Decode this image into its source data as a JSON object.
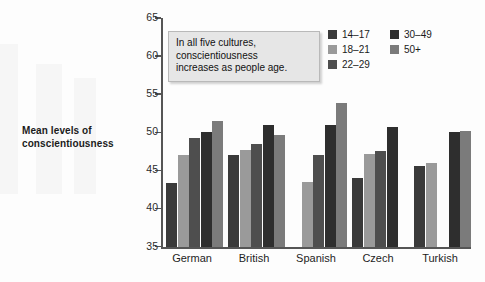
{
  "axis_title": "Mean levels of\nconscientiousness",
  "callout": {
    "text": "In all five cultures, conscientiousness increases as people age.",
    "line1": "In all five cultures,",
    "line2": "conscientiousness",
    "line3": "increases as people age."
  },
  "legend": {
    "items": [
      {
        "label": "14–17",
        "color": "#3a3a3a"
      },
      {
        "label": "18–21",
        "color": "#9a9a9a"
      },
      {
        "label": "22–29",
        "color": "#4e4e4e"
      },
      {
        "label": "30–49",
        "color": "#2e2e2e"
      },
      {
        "label": "50+",
        "color": "#7b7b7b"
      }
    ]
  },
  "chart_data": {
    "type": "bar",
    "title": "",
    "xlabel": "",
    "ylabel": "Mean levels of conscientiousness",
    "ylim": [
      35,
      65
    ],
    "yticks": [
      35,
      40,
      45,
      50,
      55,
      60,
      65
    ],
    "grid": false,
    "legend_position": "top-right",
    "categories": [
      "German",
      "British",
      "Spanish",
      "Czech",
      "Turkish"
    ],
    "series": [
      {
        "name": "14–17",
        "color": "#3a3a3a",
        "values": [
          43.4,
          47.0,
          null,
          44.0,
          45.6
        ]
      },
      {
        "name": "18–21",
        "color": "#9a9a9a",
        "values": [
          47.0,
          47.7,
          43.5,
          47.1,
          46.0
        ]
      },
      {
        "name": "22–29",
        "color": "#4e4e4e",
        "values": [
          49.3,
          48.4,
          47.0,
          47.5,
          null
        ]
      },
      {
        "name": "30–49",
        "color": "#2e2e2e",
        "values": [
          50.0,
          51.0,
          50.9,
          50.7,
          50.0
        ]
      },
      {
        "name": "50+",
        "color": "#7b7b7b",
        "values": [
          51.5,
          49.6,
          53.8,
          null,
          50.2
        ]
      }
    ],
    "annotations": [
      {
        "text": "In all five cultures, conscientiousness increases as people age."
      }
    ]
  }
}
